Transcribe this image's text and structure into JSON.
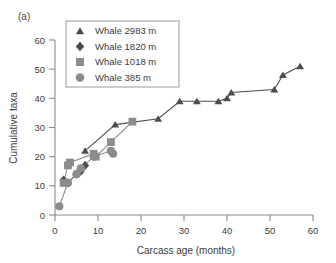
{
  "panel": {
    "label": "(a)"
  },
  "chart_data": {
    "type": "scatter",
    "title": "",
    "xlabel": "Carcass age (months)",
    "ylabel": "Cumulative taxa",
    "xlim": [
      0,
      60
    ],
    "ylim": [
      0,
      60
    ],
    "xticks": [
      0,
      10,
      20,
      30,
      40,
      50,
      60
    ],
    "yticks": [
      0,
      10,
      20,
      30,
      40,
      50,
      60
    ],
    "grid": false,
    "legend_position": "top-left",
    "series": [
      {
        "name": "Whale 2983 m",
        "marker": "triangle",
        "color": "#4d4d4d",
        "points": [
          {
            "x": 7,
            "y": 22
          },
          {
            "x": 14,
            "y": 31
          },
          {
            "x": 24,
            "y": 33
          },
          {
            "x": 29,
            "y": 39
          },
          {
            "x": 33,
            "y": 39
          },
          {
            "x": 38,
            "y": 39
          },
          {
            "x": 40,
            "y": 40
          },
          {
            "x": 41,
            "y": 42
          },
          {
            "x": 51,
            "y": 43
          },
          {
            "x": 53,
            "y": 48
          },
          {
            "x": 57,
            "y": 51
          }
        ]
      },
      {
        "name": "Whale 1820 m",
        "marker": "diamond",
        "color": "#4d4d4d",
        "points": [
          {
            "x": 2,
            "y": 12
          },
          {
            "x": 3,
            "y": 11
          },
          {
            "x": 5,
            "y": 14
          },
          {
            "x": 6,
            "y": 15
          },
          {
            "x": 7,
            "y": 17
          }
        ]
      },
      {
        "name": "Whale 1018 m",
        "marker": "square",
        "color": "#8c8c8c",
        "points": [
          {
            "x": 2,
            "y": 11
          },
          {
            "x": 3,
            "y": 17
          },
          {
            "x": 3.5,
            "y": 18
          },
          {
            "x": 9,
            "y": 21
          },
          {
            "x": 9.5,
            "y": 20
          },
          {
            "x": 13,
            "y": 25
          },
          {
            "x": 18,
            "y": 32
          }
        ]
      },
      {
        "name": "Whale 385 m",
        "marker": "circle",
        "color": "#8c8c8c",
        "points": [
          {
            "x": 1,
            "y": 3
          },
          {
            "x": 3,
            "y": 11
          },
          {
            "x": 5,
            "y": 14
          },
          {
            "x": 6,
            "y": 16
          },
          {
            "x": 9,
            "y": 20
          },
          {
            "x": 13,
            "y": 22
          },
          {
            "x": 13.5,
            "y": 21
          }
        ]
      }
    ]
  },
  "legend": {
    "entries": [
      {
        "label": "Whale 2983 m",
        "marker": "triangle",
        "color": "#4d4d4d"
      },
      {
        "label": "Whale 1820 m",
        "marker": "diamond",
        "color": "#4d4d4d"
      },
      {
        "label": "Whale 1018 m",
        "marker": "square",
        "color": "#8c8c8c"
      },
      {
        "label": "Whale 385 m",
        "marker": "circle",
        "color": "#8c8c8c"
      }
    ]
  }
}
